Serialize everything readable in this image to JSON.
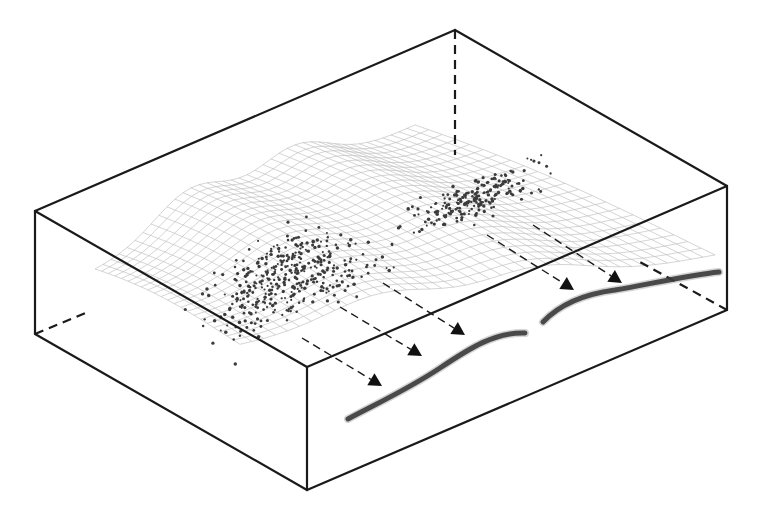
{
  "figure": {
    "colors": {
      "edge": "#1a1a1a",
      "mesh": "#b9b9b9",
      "points": "#3b3b3b",
      "curve": "#3a3a3a",
      "background": "#ffffff"
    }
  },
  "box": {
    "visible_edges": [
      {
        "name": "top-left-edge",
        "x1": 35,
        "y1": 211,
        "x2": 455,
        "y2": 30
      },
      {
        "name": "top-back-right-edge",
        "x1": 455,
        "y1": 30,
        "x2": 727,
        "y2": 186
      },
      {
        "name": "top-front-left-edge",
        "x1": 35,
        "y1": 211,
        "x2": 307,
        "y2": 367
      },
      {
        "name": "top-front-right-edge",
        "x1": 307,
        "y1": 367,
        "x2": 727,
        "y2": 186
      },
      {
        "name": "left-vertical-edge",
        "x1": 35,
        "y1": 211,
        "x2": 35,
        "y2": 334
      },
      {
        "name": "front-vertical-edge",
        "x1": 307,
        "y1": 367,
        "x2": 307,
        "y2": 490
      },
      {
        "name": "right-vertical-edge",
        "x1": 727,
        "y1": 186,
        "x2": 727,
        "y2": 310
      },
      {
        "name": "bottom-left-edge",
        "x1": 35,
        "y1": 334,
        "x2": 307,
        "y2": 490
      },
      {
        "name": "bottom-right-edge",
        "x1": 307,
        "y1": 490,
        "x2": 727,
        "y2": 310
      }
    ],
    "hidden_edges": [
      {
        "name": "back-vertical-hidden-edge",
        "x1": 455,
        "y1": 30,
        "x2": 455,
        "y2": 155
      },
      {
        "name": "left-bottom-hidden-edge",
        "x1": 35,
        "y1": 334,
        "x2": 88,
        "y2": 312
      },
      {
        "name": "right-bottom-hidden-edge",
        "x1": 727,
        "y1": 310,
        "x2": 640,
        "y2": 262
      }
    ]
  },
  "arrows": [
    {
      "x1": 302,
      "y1": 338,
      "x2": 382,
      "y2": 386
    },
    {
      "x1": 340,
      "y1": 307,
      "x2": 422,
      "y2": 356
    },
    {
      "x1": 383,
      "y1": 283,
      "x2": 465,
      "y2": 335
    },
    {
      "x1": 487,
      "y1": 235,
      "x2": 574,
      "y2": 290
    },
    {
      "x1": 533,
      "y1": 225,
      "x2": 622,
      "y2": 283
    },
    {
      "x1": 538,
      "y1": 265,
      "x2": 460,
      "y2": 222,
      "hidden": true
    }
  ],
  "curves": [
    {
      "name": "projected-curve-left",
      "d": "M348,419 C380,402 410,388 440,368 C470,348 495,332 525,333"
    },
    {
      "name": "projected-curve-right",
      "d": "M543,322 C560,304 585,294 615,290 C650,284 690,275 719,272"
    }
  ],
  "mesh": {
    "name": "wavy-surface",
    "rows": 22,
    "cols": 40
  },
  "clusters": [
    {
      "name": "point-cluster-left",
      "cx": 290,
      "cy": 275,
      "rx": 120,
      "ry": 45,
      "count": 380,
      "seed": 7
    },
    {
      "name": "point-cluster-right",
      "cx": 470,
      "cy": 200,
      "rx": 105,
      "ry": 22,
      "count": 210,
      "seed": 13
    }
  ]
}
